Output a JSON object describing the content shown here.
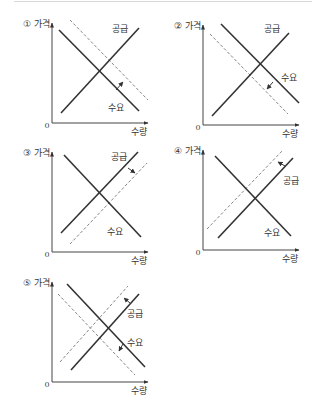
{
  "axis_labels": {
    "y": "가격",
    "x": "수량",
    "origin": "0"
  },
  "curve_labels": {
    "supply": "공급",
    "demand": "수요"
  },
  "colors": {
    "line": "#333333",
    "dashed": "#777777",
    "axis": "#444444"
  },
  "chart_data": [
    {
      "type": "diagram",
      "option": "①",
      "description": "Demand shifts right (increase)",
      "origin": [
        52,
        123
      ],
      "supply": [
        [
          61,
          113
        ],
        [
          139,
          28
        ]
      ],
      "demand": [
        [
          59,
          30
        ],
        [
          139,
          111
        ]
      ],
      "dashed": [
        [
          [
            70,
            20
          ],
          [
            148,
            100
          ]
        ]
      ],
      "arrows": [
        [
          [
            116,
            90
          ],
          [
            123,
            82
          ]
        ]
      ],
      "supply_label_pos": [
        112,
        32
      ],
      "demand_label_pos": [
        108,
        111
      ]
    },
    {
      "type": "diagram",
      "option": "②",
      "description": "Demand shifts left (decrease)",
      "origin": [
        203,
        125
      ],
      "supply": [
        [
          212,
          116
        ],
        [
          289,
          33
        ]
      ],
      "demand": [
        [
          221,
          24
        ],
        [
          299,
          103
        ]
      ],
      "dashed": [
        [
          [
            210,
            34
          ],
          [
            288,
            114
          ]
        ]
      ],
      "arrows": [
        [
          [
            273,
            82
          ],
          [
            267,
            89
          ]
        ]
      ],
      "supply_label_pos": [
        264,
        32
      ],
      "demand_label_pos": [
        281,
        81
      ]
    },
    {
      "type": "diagram",
      "option": "③",
      "description": "Supply shifts right (increase)",
      "origin": [
        52,
        252
      ],
      "supply": [
        [
          61,
          233
        ],
        [
          138,
          152
        ]
      ],
      "demand": [
        [
          64,
          155
        ],
        [
          141,
          237
        ]
      ],
      "dashed": [
        [
          [
            70,
            244
          ],
          [
            147,
            163
          ]
        ]
      ],
      "arrows": [
        [
          [
            128,
            168
          ],
          [
            135,
            173
          ]
        ]
      ],
      "supply_label_pos": [
        111,
        160
      ],
      "demand_label_pos": [
        107,
        235
      ]
    },
    {
      "type": "diagram",
      "option": "④",
      "description": "Supply shifts left (decrease)",
      "origin": [
        203,
        250
      ],
      "supply": [
        [
          218,
          238
        ],
        [
          293,
          158
        ]
      ],
      "demand": [
        [
          215,
          156
        ],
        [
          291,
          236
        ]
      ],
      "dashed": [
        [
          [
            207,
            229
          ],
          [
            283,
            150
          ]
        ]
      ],
      "arrows": [
        [
          [
            285,
            166
          ],
          [
            278,
            162
          ]
        ]
      ],
      "supply_label_pos": [
        283,
        184
      ],
      "demand_label_pos": [
        264,
        236
      ]
    },
    {
      "type": "diagram",
      "option": "⑤",
      "description": "Supply decreases and demand decreases",
      "origin": [
        52,
        382
      ],
      "supply": [
        [
          71,
          370
        ],
        [
          139,
          294
        ]
      ],
      "demand": [
        [
          67,
          284
        ],
        [
          145,
          367
        ]
      ],
      "dashed": [
        [
          [
            60,
            362
          ],
          [
            128,
            286
          ]
        ],
        [
          [
            58,
            294
          ],
          [
            135,
            375
          ]
        ]
      ],
      "arrows": [
        [
          [
            130,
            303
          ],
          [
            124,
            298
          ]
        ],
        [
          [
            123,
            344
          ],
          [
            119,
            351
          ]
        ]
      ],
      "supply_label_pos": [
        127,
        317
      ],
      "demand_label_pos": [
        127,
        346
      ]
    }
  ],
  "panels": [
    {
      "label": "① 가격"
    },
    {
      "label": "② 가격"
    },
    {
      "label": "③ 가격"
    },
    {
      "label": "④ 가격"
    },
    {
      "label": "⑤ 가격"
    }
  ]
}
